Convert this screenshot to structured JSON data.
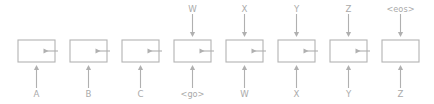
{
  "diagram": {
    "type": "seq2seq-unrolled-rnn",
    "colors": {
      "background": "#ffffff",
      "stroke": "#b3b3b3",
      "arrow": "#b0b0b0",
      "text": "#aaaaaa"
    },
    "layout": {
      "width": 434,
      "height": 104,
      "cell_count": 8,
      "cell_pitch": 52,
      "cell_width": 37,
      "cell_height": 22,
      "first_cell_left": 18,
      "cell_top": 40,
      "input_label_baseline": 97,
      "output_label_baseline": 12
    },
    "cells": [
      {
        "index": 0,
        "role": "encoder",
        "input_label": "A",
        "output_label": "",
        "has_output_arrow": false,
        "has_input_arrow": true,
        "has_right_arrow": true,
        "cx": 36.5
      },
      {
        "index": 1,
        "role": "encoder",
        "input_label": "B",
        "output_label": "",
        "has_output_arrow": false,
        "has_input_arrow": true,
        "has_right_arrow": true,
        "cx": 88.5
      },
      {
        "index": 2,
        "role": "encoder",
        "input_label": "C",
        "output_label": "",
        "has_output_arrow": false,
        "has_input_arrow": true,
        "has_right_arrow": true,
        "cx": 140.5
      },
      {
        "index": 3,
        "role": "decoder",
        "input_label": "<go>",
        "output_label": "W",
        "has_output_arrow": true,
        "has_input_arrow": true,
        "has_right_arrow": true,
        "cx": 192.5
      },
      {
        "index": 4,
        "role": "decoder",
        "input_label": "W",
        "output_label": "X",
        "has_output_arrow": true,
        "has_input_arrow": true,
        "has_right_arrow": true,
        "cx": 244.5
      },
      {
        "index": 5,
        "role": "decoder",
        "input_label": "X",
        "output_label": "Y",
        "has_output_arrow": true,
        "has_input_arrow": true,
        "has_right_arrow": true,
        "cx": 296.5
      },
      {
        "index": 6,
        "role": "decoder",
        "input_label": "Y",
        "output_label": "Z",
        "has_output_arrow": true,
        "has_input_arrow": true,
        "has_right_arrow": true,
        "cx": 348.5
      },
      {
        "index": 7,
        "role": "decoder",
        "input_label": "Z",
        "output_label": "<eos>",
        "has_output_arrow": true,
        "has_input_arrow": true,
        "has_right_arrow": false,
        "cx": 400.5
      }
    ],
    "input_sequence": [
      "A",
      "B",
      "C",
      "<go>",
      "W",
      "X",
      "Y",
      "Z"
    ],
    "output_sequence": [
      "W",
      "X",
      "Y",
      "Z",
      "<eos>"
    ]
  }
}
